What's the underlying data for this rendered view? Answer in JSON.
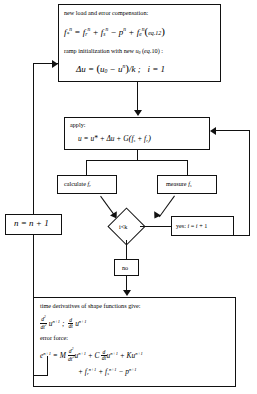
{
  "diagram": {
    "type": "flowchart",
    "nodes": {
      "compensation": {
        "name": "new-load-error-compensation",
        "caption": "new load and error compensation:",
        "equation_1": "f*^n = f_r^n + f_s^n - p^n + f_e^n (eq.12)",
        "caption_2": "ramp initialization with new u₀ (eq.10) :",
        "equation_2": "Δu = (u₀ - u^n)/k ;   i = 1",
        "eq_ref_1": "eq.12",
        "eq_ref_2": "eq.10"
      },
      "apply": {
        "name": "apply",
        "caption": "apply:",
        "equation": "u = u* + Δu + G(f_s + f_r)",
        "eq_ref": "eq.10"
      },
      "calculate": {
        "name": "calculate-fr",
        "label": "calculate f_r",
        "text": "calculate",
        "symbol": "f",
        "subscript": "r"
      },
      "measure": {
        "name": "measure-fs",
        "label": "measure f_s",
        "text": "measure",
        "symbol": "f",
        "subscript": "s"
      },
      "decision": {
        "name": "iteration-check",
        "label": "i<k",
        "condition": "i<k"
      },
      "yes_branch": {
        "name": "yes-increment-i",
        "label": "yes: i = i + 1",
        "prefix": "yes:",
        "equation": "i = i + 1"
      },
      "no_branch": {
        "name": "no-branch",
        "label": "no"
      },
      "step_counter": {
        "name": "increment-n",
        "label": "n = n + 1"
      },
      "derivatives": {
        "name": "time-derivatives-error-force",
        "caption": "time derivatives of shape functions give:",
        "equation_1": "d²/dt² u^{n+1} ;  d/dt u^{n+1}",
        "caption_2": "error force:",
        "equation_2": "e^{n+1} = M d²/dt² u^{n+1} + C d/dt u^{n+1} + K u^{n+1}",
        "equation_3": "+ f_r^{n+1} + f_s^{n+1} - p^{n+1}"
      }
    },
    "edges": [
      {
        "from": "compensation",
        "to": "apply",
        "label": ""
      },
      {
        "from": "apply",
        "to": "calculate",
        "label": ""
      },
      {
        "from": "apply",
        "to": "measure",
        "label": ""
      },
      {
        "from": "calculate",
        "to": "decision",
        "label": ""
      },
      {
        "from": "measure",
        "to": "decision",
        "label": ""
      },
      {
        "from": "decision",
        "to": "yes_branch",
        "label": "yes"
      },
      {
        "from": "yes_branch",
        "to": "apply",
        "label": ""
      },
      {
        "from": "decision",
        "to": "no_branch",
        "label": "no"
      },
      {
        "from": "no_branch",
        "to": "derivatives",
        "label": ""
      },
      {
        "from": "derivatives",
        "to": "step_counter",
        "label": ""
      },
      {
        "from": "step_counter",
        "to": "compensation",
        "label": ""
      }
    ],
    "colors": {
      "stroke": "#111111",
      "background": "#ffffff",
      "text": "#000000"
    }
  }
}
